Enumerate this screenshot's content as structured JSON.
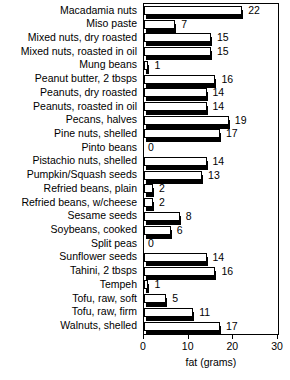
{
  "chart_data": {
    "type": "bar",
    "orientation": "horizontal",
    "title": "",
    "xlabel": "fat (grams)",
    "ylabel": "",
    "xlim": [
      0,
      30
    ],
    "xticks": [
      0,
      10,
      20,
      30
    ],
    "xtick_labels": [
      "0",
      "10",
      "20",
      "30"
    ],
    "grid": false,
    "legend": null,
    "categories": [
      "Macadamia nuts",
      "Miso paste",
      "Mixed nuts, dry roasted",
      "Mixed nuts, roasted in oil",
      "Mung beans",
      "Peanut butter, 2 tbsps",
      "Peanuts, dry roasted",
      "Peanuts, roasted in oil",
      "Pecans, halves",
      "Pine nuts, shelled",
      "Pinto beans",
      "Pistachio nuts, shelled",
      "Pumpkin/Squash seeds",
      "Refried beans, plain",
      "Refried beans, w/cheese",
      "Sesame seeds",
      "Soybeans, cooked",
      "Split peas",
      "Sunflower seeds",
      "Tahini, 2 tbsps",
      "Tempeh",
      "Tofu, raw, soft",
      "Tofu, raw, firm",
      "Walnuts, shelled"
    ],
    "values": [
      22,
      7,
      15,
      15,
      1,
      16,
      14,
      14,
      19,
      17,
      0,
      14,
      13,
      2,
      2,
      8,
      6,
      0,
      14,
      16,
      1,
      5,
      11,
      17
    ],
    "value_labels": [
      "22",
      "7",
      "15",
      "15",
      "1",
      "16",
      "14",
      "14",
      "19",
      "17",
      "0",
      "14",
      "13",
      "2",
      "2",
      "8",
      "6",
      "0",
      "14",
      "16",
      "1",
      "5",
      "11",
      "17"
    ]
  },
  "style": {
    "bar_face_color": "#ffffff",
    "bar_edge_color": "#000000",
    "bar_shadow_color": "#000000",
    "axis_color": "#000000",
    "text_color": "#000000",
    "background_color": "#ffffff"
  }
}
